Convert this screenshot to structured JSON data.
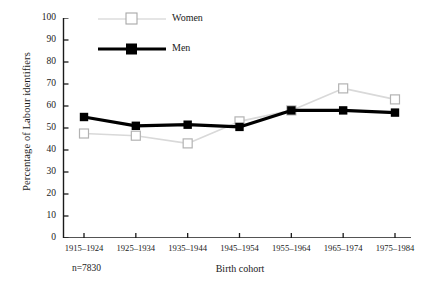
{
  "chart_data": {
    "type": "line",
    "title": "",
    "subtitle": "",
    "xlabel": "Birth cohort",
    "ylabel": "Percentage of Labour identifiers",
    "categories": [
      "1915–1924",
      "1925–1934",
      "1935–1944",
      "1945–1954",
      "1955–1964",
      "1965–1974",
      "1975–1984"
    ],
    "series": [
      {
        "name": "Women",
        "color": "#d9d9d9",
        "marker": "open-square",
        "values": [
          47.5,
          46.5,
          43.0,
          53.0,
          58.0,
          68.0,
          63.0
        ]
      },
      {
        "name": "Men",
        "color": "#000000",
        "marker": "filled-square",
        "values": [
          55.0,
          51.0,
          51.5,
          50.5,
          58.0,
          58.0,
          57.0
        ]
      }
    ],
    "ylim": [
      0,
      100
    ],
    "ytick_step": 10,
    "yticks": [
      "100",
      "90",
      "80",
      "70",
      "60",
      "50",
      "40",
      "30",
      "20",
      "10",
      "0"
    ],
    "grid": false,
    "legend_position": "top-left-inside",
    "annotations": [
      {
        "name": "sample-size",
        "text": "n=7830"
      }
    ]
  },
  "legend": {
    "items": [
      {
        "label": "Women"
      },
      {
        "label": "Men"
      }
    ]
  },
  "notes": {
    "sample_size": "n=7830"
  },
  "colors": {
    "women_line": "#d9d9d9",
    "women_marker_edge": "#b3b3b3",
    "men_line": "#000000",
    "axis": "#1a1a1a"
  }
}
